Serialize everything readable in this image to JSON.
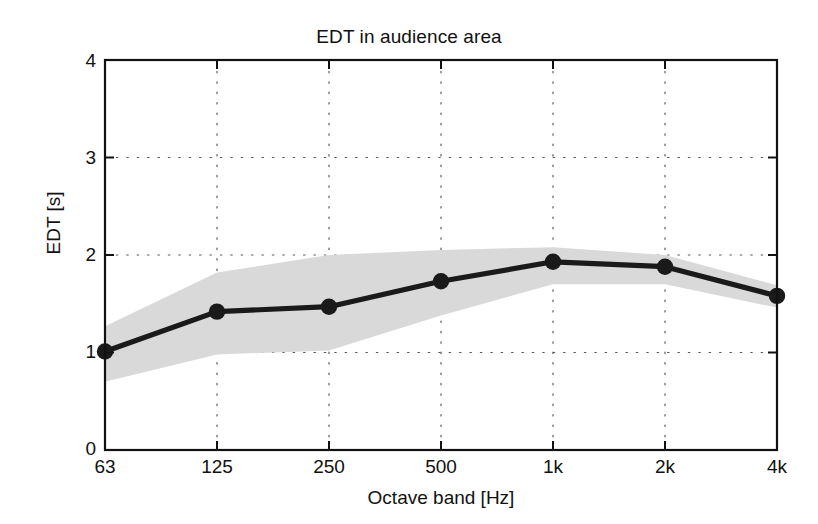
{
  "chart_data": {
    "type": "line",
    "title": "EDT in audience area",
    "xlabel": "Octave band [Hz]",
    "ylabel": "EDT [s]",
    "categories": [
      "63",
      "125",
      "250",
      "500",
      "1k",
      "2k",
      "4k"
    ],
    "series": [
      {
        "name": "EDT mean",
        "values": [
          1.01,
          1.42,
          1.47,
          1.73,
          1.93,
          1.88,
          1.58
        ],
        "marker": "filled-circle",
        "color": "#1a1a1a"
      }
    ],
    "band": {
      "name": "spatial spread",
      "color": "#d9d9d9",
      "upper": [
        1.27,
        1.82,
        2.0,
        2.05,
        2.08,
        2.0,
        1.69
      ],
      "lower": [
        0.7,
        0.98,
        1.02,
        1.38,
        1.7,
        1.7,
        1.46
      ]
    },
    "xlim": [
      0,
      6
    ],
    "ylim": [
      0,
      4
    ],
    "yticks": [
      0,
      1,
      2,
      3,
      4
    ],
    "ytick_labels": [
      "0",
      "1",
      "2",
      "3",
      "4"
    ],
    "grid": "dotted",
    "legend": "none"
  },
  "axes": {
    "y_tick_0": "0",
    "y_tick_1": "1",
    "y_tick_2": "2",
    "y_tick_3": "3",
    "y_tick_4": "4",
    "x_tick_0": "63",
    "x_tick_1": "125",
    "x_tick_2": "250",
    "x_tick_3": "500",
    "x_tick_4": "1k",
    "x_tick_5": "2k",
    "x_tick_6": "4k"
  }
}
